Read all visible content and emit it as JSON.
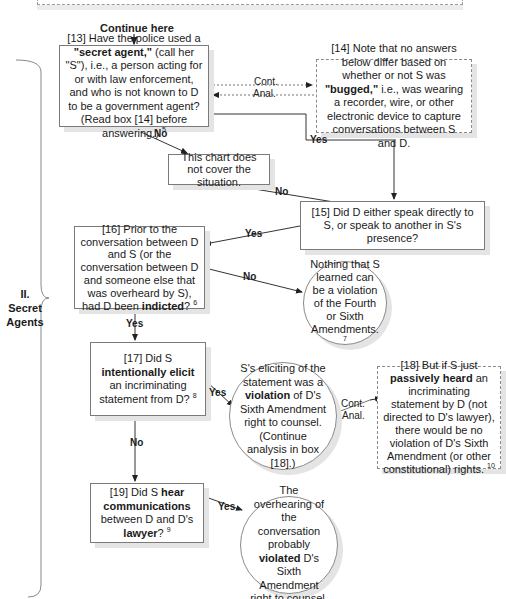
{
  "header": {
    "continue_label": "Continue here"
  },
  "section": {
    "numeral": "II.",
    "title_line1": "Secret",
    "title_line2": "Agents"
  },
  "nodes": {
    "q13": {
      "prefix": "[13] Have the police used a ",
      "bold": "\"secret agent,\"",
      "rest": " (call her \"S\"), i.e., a person acting for or with law enforcement, and who is not known to D to be a government agent? (Read box [14] before answering.)",
      "footnote": "5"
    },
    "note14": {
      "prefix": "[14] Note that no answers below differ based on whether or not S was ",
      "bold": "\"bugged,\"",
      "rest": " i.e., was wearing a recorder, wire, or other electronic device to capture conversations between S and D."
    },
    "no_cover": {
      "text": "This chart does not cover the situation."
    },
    "q15": {
      "text": "[15] Did D either speak directly to S, or speak to another in S's presence?"
    },
    "q16": {
      "prefix": "[16] Prior to the conversation between D and S (or the conversation between D and someone else that was overheard by S), had D been ",
      "bold": "indicted",
      "rest": "?",
      "footnote": "6"
    },
    "nothing_learned": {
      "text": "Nothing that S learned can be a violation of the Fourth or Sixth Amendments.",
      "footnote": "7"
    },
    "q17": {
      "prefix": "[17] Did S ",
      "bold1": "intentionally elicit",
      "rest": " an incriminating statement from D?",
      "footnote": "8"
    },
    "violation17": {
      "prefix": "S's eliciting of the statement was a ",
      "bold": "violation",
      "rest": " of D's Sixth Amendment right to counsel. (Continue analysis in box [18].)"
    },
    "note18": {
      "prefix": "[18] But if S just ",
      "bold": "passively heard",
      "rest": " an incriminating statement by D (not directed to D's lawyer), there would be no violation of D's Sixth Amendment (or other constitutional) rights.",
      "footnote": "10"
    },
    "q19": {
      "prefix": "[19] Did S ",
      "bold1": "hear communications",
      "mid": " between D and D's ",
      "bold2": "lawyer",
      "rest": "?",
      "footnote": "9"
    },
    "violation19": {
      "prefix": "The overhearing of the conversation probably ",
      "bold": "violated",
      "rest": " D's Sixth Amendment right to counsel."
    }
  },
  "edges": {
    "yes": "Yes",
    "no": "No",
    "cont": "Cont.",
    "anal": "Anal."
  }
}
